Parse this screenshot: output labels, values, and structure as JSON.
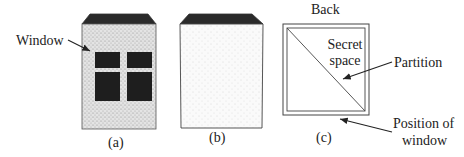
{
  "figure": {
    "panels": [
      {
        "id": "a",
        "caption": "(a)",
        "description": "Box front with window"
      },
      {
        "id": "b",
        "caption": "(b)",
        "description": "Box side, plain"
      },
      {
        "id": "c",
        "caption": "(c)",
        "description": "Top view with diagonal partition"
      }
    ],
    "labels": {
      "window": "Window",
      "back": "Back",
      "secret_space_line1": "Secret",
      "secret_space_line2": "space",
      "partition": "Partition",
      "position_line1": "Position of",
      "position_line2": "window"
    },
    "colors": {
      "stipple_dark": "#c8c8c8",
      "stipple_light": "#efefef",
      "window_fill": "#1e1e1e",
      "lid_fill": "#2a2a2a",
      "line": "#333333"
    }
  }
}
